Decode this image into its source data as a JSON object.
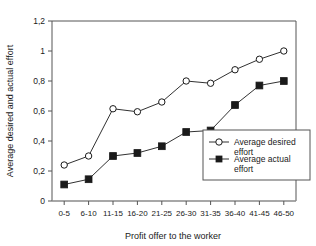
{
  "chart_data": {
    "type": "line",
    "title": "",
    "xlabel": "Profit offer to the worker",
    "ylabel": "Average desired and actual effort",
    "categories": [
      "0-5",
      "6-10",
      "11-15",
      "16-20",
      "21-25",
      "26-30",
      "31-35",
      "36-40",
      "41-45",
      "46-50"
    ],
    "ylim": [
      0,
      1.2
    ],
    "ytick_labels": [
      "0",
      "0,2",
      "0,4",
      "0,6",
      "0,8",
      "1",
      "1,2"
    ],
    "ytick_values": [
      0,
      0.2,
      0.4,
      0.6,
      0.8,
      1.0,
      1.2
    ],
    "grid": false,
    "legend_position": "inside-bottom-right",
    "series": [
      {
        "name": "Average desired effort",
        "marker": "open-circle",
        "color": "#1a1a1a",
        "values": [
          0.24,
          0.3,
          0.615,
          0.595,
          0.66,
          0.8,
          0.785,
          0.875,
          0.945,
          1.0
        ]
      },
      {
        "name": "Average actual effort",
        "marker": "filled-square",
        "color": "#1a1a1a",
        "values": [
          0.11,
          0.145,
          0.3,
          0.32,
          0.365,
          0.46,
          0.47,
          0.64,
          0.77,
          0.8
        ]
      }
    ]
  },
  "legend": {
    "entries": [
      {
        "label_line1": "Average desired",
        "label_line2": "effort",
        "marker": "open-circle"
      },
      {
        "label_line1": "Average actual",
        "label_line2": "effort",
        "marker": "filled-square"
      }
    ]
  },
  "axes": {
    "x_title": "Profit offer to the worker",
    "y_title": "Average desired and actual effort"
  }
}
